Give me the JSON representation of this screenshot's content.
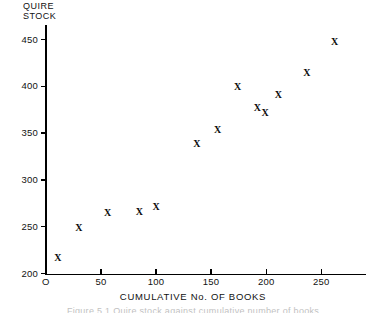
{
  "chart_data": {
    "type": "scatter",
    "title": "",
    "xlabel": "CUMULATIVE No. OF BOOKS",
    "ylabel": "QUIRE\nSTOCK",
    "marker_glyph": "X",
    "grid": false,
    "legend": null,
    "xlim": [
      0,
      290
    ],
    "ylim": [
      200,
      465
    ],
    "xticks": [
      0,
      50,
      100,
      150,
      200,
      250
    ],
    "xtick_labels": [
      "O",
      "50",
      "100",
      "150",
      "200",
      "250"
    ],
    "yticks": [
      200,
      250,
      300,
      350,
      400,
      450
    ],
    "ytick_labels": [
      "200",
      "250",
      "300",
      "350",
      "400",
      "450"
    ],
    "points": [
      {
        "x": 11,
        "y": 217
      },
      {
        "x": 30,
        "y": 249
      },
      {
        "x": 56,
        "y": 265
      },
      {
        "x": 85,
        "y": 266
      },
      {
        "x": 100,
        "y": 271
      },
      {
        "x": 137,
        "y": 338
      },
      {
        "x": 156,
        "y": 353
      },
      {
        "x": 174,
        "y": 399
      },
      {
        "x": 192,
        "y": 377
      },
      {
        "x": 211,
        "y": 391
      },
      {
        "x": 237,
        "y": 414
      },
      {
        "x": 262,
        "y": 447
      },
      {
        "x": 199,
        "y": 372
      }
    ],
    "caption_partial": "Figure 5.1 Quire stock against cumulative number of books"
  }
}
